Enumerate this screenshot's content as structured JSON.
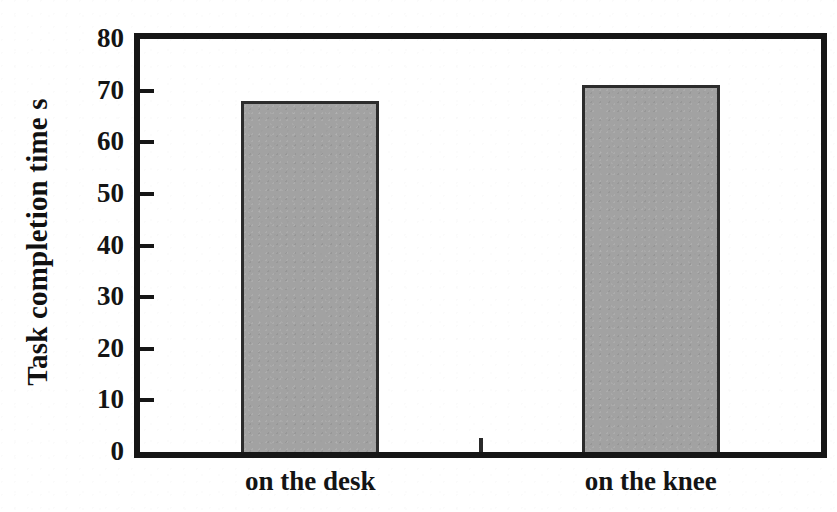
{
  "chart_data": {
    "type": "bar",
    "title": "",
    "subtitle": "",
    "xlabel": "",
    "ylabel": "Task completion time  s",
    "categories": [
      "on the desk",
      "on the knee"
    ],
    "values": [
      68,
      71
    ],
    "series": [
      {
        "name": "Task completion time",
        "values": [
          68,
          71
        ]
      }
    ],
    "ylim": [
      0,
      80
    ],
    "y_ticks": [
      0,
      10,
      20,
      30,
      40,
      50,
      60,
      70,
      80
    ],
    "y_tick_labels": [
      "0",
      "10",
      "20",
      "30",
      "40",
      "50",
      "60",
      "70",
      "80"
    ],
    "grid": false,
    "legend": false,
    "legend_position": "none",
    "annotations": [],
    "colors": {
      "bar_fill": "#a2a2a2",
      "bar_edge": "#2c2c2c",
      "axis": "#161616",
      "text": "#141414",
      "background": "#ffffff"
    },
    "bar_geometry": [
      {
        "category": "on the desk",
        "center_fraction": 0.25,
        "width_fraction": 0.202
      },
      {
        "category": "on the knee",
        "center_fraction": 0.75,
        "width_fraction": 0.202
      }
    ]
  },
  "axis": {
    "y_title": "Task completion time  s",
    "y_unit": "s",
    "bottom_center_tick": true
  }
}
